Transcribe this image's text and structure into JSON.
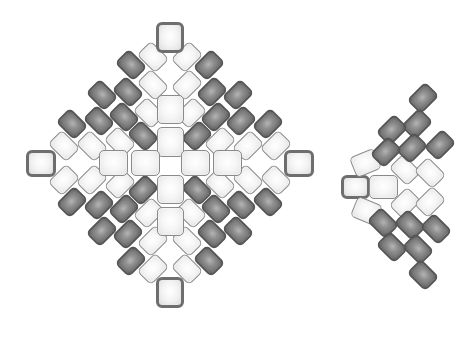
{
  "diagram": {
    "colors": {
      "light_bead": "#f4f4f4",
      "dark_bead": "#8c8c8c",
      "light_border": "#8a8a8a",
      "dark_border": "#555555",
      "cap_border": "#6e6e6e",
      "background": "#ffffff"
    },
    "main_motif": {
      "center": [
        170,
        163
      ],
      "diagonal_bead_size": [
        26,
        20
      ],
      "quadrant_beads": [
        {
          "dx": 17,
          "dy": -106,
          "tone": "light"
        },
        {
          "dx": 17,
          "dy": -78,
          "tone": "light"
        },
        {
          "dx": 21,
          "dy": -50,
          "tone": "light"
        },
        {
          "dx": 50,
          "dy": -21,
          "tone": "light"
        },
        {
          "dx": 78,
          "dy": -17,
          "tone": "light"
        },
        {
          "dx": 106,
          "dy": -17,
          "tone": "light"
        },
        {
          "dx": 39,
          "dy": -98,
          "tone": "dark"
        },
        {
          "dx": 42,
          "dy": -71,
          "tone": "dark"
        },
        {
          "dx": 68,
          "dy": -68,
          "tone": "dark"
        },
        {
          "dx": 46,
          "dy": -46,
          "tone": "dark"
        },
        {
          "dx": 71,
          "dy": -42,
          "tone": "dark"
        },
        {
          "dx": 98,
          "dy": -39,
          "tone": "dark"
        },
        {
          "dx": 27,
          "dy": -27,
          "tone": "dark"
        }
      ],
      "axis_beads": [
        {
          "x": 170,
          "y": 37,
          "w": 28,
          "h": 31,
          "tone": "cap"
        },
        {
          "x": 170,
          "y": 109,
          "w": 27,
          "h": 29,
          "tone": "light"
        },
        {
          "x": 170,
          "y": 142,
          "w": 27,
          "h": 30,
          "tone": "light"
        },
        {
          "x": 170,
          "y": 189,
          "w": 27,
          "h": 29,
          "tone": "light"
        },
        {
          "x": 170,
          "y": 221,
          "w": 27,
          "h": 29,
          "tone": "light"
        },
        {
          "x": 170,
          "y": 292,
          "w": 28,
          "h": 31,
          "tone": "cap"
        },
        {
          "x": 41,
          "y": 163,
          "w": 30,
          "h": 27,
          "tone": "cap"
        },
        {
          "x": 113,
          "y": 163,
          "w": 29,
          "h": 26,
          "tone": "light"
        },
        {
          "x": 145,
          "y": 163,
          "w": 29,
          "h": 26,
          "tone": "light"
        },
        {
          "x": 195,
          "y": 163,
          "w": 29,
          "h": 26,
          "tone": "light"
        },
        {
          "x": 227,
          "y": 163,
          "w": 29,
          "h": 26,
          "tone": "light"
        },
        {
          "x": 299,
          "y": 163,
          "w": 30,
          "h": 27,
          "tone": "cap"
        }
      ]
    },
    "partial_motif_right": {
      "beads": [
        {
          "x": 355,
          "y": 187,
          "w": 29,
          "h": 24,
          "rot": 0,
          "tone": "cap"
        },
        {
          "x": 383,
          "y": 187,
          "w": 29,
          "h": 24,
          "rot": 0,
          "tone": "light"
        },
        {
          "x": 365,
          "y": 163,
          "w": 27,
          "h": 22,
          "rot": -22,
          "tone": "light"
        },
        {
          "x": 366,
          "y": 211,
          "w": 27,
          "h": 22,
          "rot": 22,
          "tone": "light"
        },
        {
          "x": 405,
          "y": 170,
          "w": 26,
          "h": 20,
          "rot": 45,
          "tone": "light"
        },
        {
          "x": 405,
          "y": 203,
          "w": 26,
          "h": 20,
          "rot": -45,
          "tone": "light"
        },
        {
          "x": 430,
          "y": 173,
          "w": 26,
          "h": 20,
          "rot": 45,
          "tone": "light"
        },
        {
          "x": 430,
          "y": 202,
          "w": 26,
          "h": 20,
          "rot": -45,
          "tone": "light"
        },
        {
          "x": 423,
          "y": 98,
          "w": 26,
          "h": 20,
          "rot": -45,
          "tone": "dark"
        },
        {
          "x": 417,
          "y": 124,
          "w": 26,
          "h": 20,
          "rot": -45,
          "tone": "dark"
        },
        {
          "x": 392,
          "y": 130,
          "w": 26,
          "h": 20,
          "rot": -45,
          "tone": "dark"
        },
        {
          "x": 412,
          "y": 148,
          "w": 26,
          "h": 20,
          "rot": -45,
          "tone": "dark"
        },
        {
          "x": 386,
          "y": 152,
          "w": 26,
          "h": 20,
          "rot": -45,
          "tone": "dark"
        },
        {
          "x": 383,
          "y": 223,
          "w": 26,
          "h": 20,
          "rot": 45,
          "tone": "dark"
        },
        {
          "x": 410,
          "y": 225,
          "w": 26,
          "h": 20,
          "rot": 45,
          "tone": "dark"
        },
        {
          "x": 392,
          "y": 247,
          "w": 26,
          "h": 20,
          "rot": 45,
          "tone": "dark"
        },
        {
          "x": 418,
          "y": 249,
          "w": 26,
          "h": 20,
          "rot": 45,
          "tone": "dark"
        },
        {
          "x": 423,
          "y": 275,
          "w": 26,
          "h": 20,
          "rot": 45,
          "tone": "dark"
        },
        {
          "x": 436,
          "y": 229,
          "w": 26,
          "h": 20,
          "rot": 45,
          "tone": "dark"
        },
        {
          "x": 440,
          "y": 145,
          "w": 26,
          "h": 20,
          "rot": -45,
          "tone": "dark"
        }
      ]
    }
  }
}
